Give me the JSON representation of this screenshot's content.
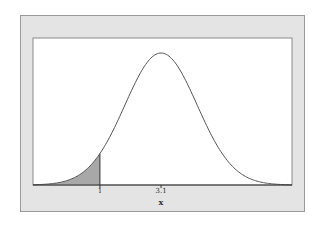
{
  "chart_data": {
    "type": "area",
    "title": "",
    "xlabel": "x",
    "ylabel": "",
    "distribution": "normal",
    "mean": 3.1,
    "sd": 1.24,
    "xlim": [
      -1.3,
      7.6
    ],
    "shaded_region": {
      "from": -1.3,
      "to": 1,
      "color": "#a8a8a8"
    },
    "tick_labels": [
      {
        "value": 1,
        "label": "1"
      },
      {
        "value": 3.1,
        "label": "3.1"
      }
    ],
    "curve_color": "#555555",
    "frame_background": "#e4e4e4",
    "plot_background": "#ffffff",
    "grid": false
  },
  "axis": {
    "xlabel": "x",
    "ticks": [
      "1",
      "3.1"
    ]
  }
}
